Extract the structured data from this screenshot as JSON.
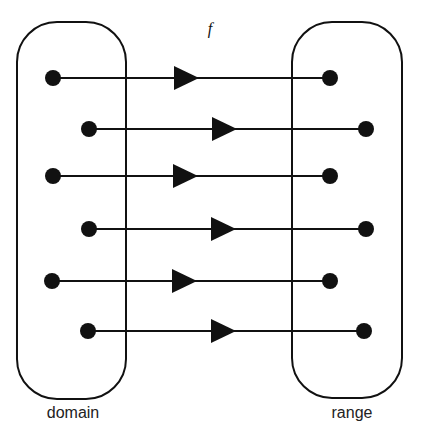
{
  "diagram": {
    "type": "function-mapping",
    "function_label": "f",
    "domain_label": "domain",
    "range_label": "range",
    "stroke_color": "#111111",
    "background": "#ffffff",
    "mappings": [
      {
        "from": 1,
        "to": 1
      },
      {
        "from": 2,
        "to": 2
      },
      {
        "from": 3,
        "to": 3
      },
      {
        "from": 4,
        "to": 4
      },
      {
        "from": 5,
        "to": 5
      },
      {
        "from": 6,
        "to": 6
      }
    ],
    "domain_element_count": 6,
    "range_element_count": 6
  }
}
